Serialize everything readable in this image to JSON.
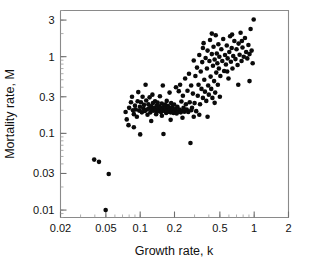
{
  "chart_data": {
    "type": "scatter",
    "title": "",
    "xlabel": "Growth rate, k",
    "ylabel": "Mortality rate, M",
    "xscale": "log",
    "yscale": "log",
    "xlim": [
      0.02,
      2
    ],
    "ylim": [
      0.008,
      4.0
    ],
    "grid": false,
    "legend": null,
    "xticks": [
      0.02,
      0.05,
      0.1,
      0.2,
      0.5,
      1,
      2
    ],
    "xtick_labels": [
      "0.02",
      "0.05",
      "0.1",
      "0.2",
      "0.5",
      "1",
      "2"
    ],
    "yticks": [
      0.01,
      0.03,
      0.1,
      0.3,
      1,
      3
    ],
    "ytick_labels": [
      "0.01",
      "0.03",
      "0.1",
      "0.3",
      "1",
      "3"
    ],
    "marker": "filled-circle",
    "marker_color": "#0a0a0a",
    "marker_size_px": 4.6,
    "n_points": 178,
    "points": [
      [
        0.0395,
        0.0455
      ],
      [
        0.0435,
        0.0425
      ],
      [
        0.053,
        0.0295
      ],
      [
        0.0498,
        0.01
      ],
      [
        0.0745,
        0.19
      ],
      [
        0.0762,
        0.152
      ],
      [
        0.079,
        0.128
      ],
      [
        0.08,
        0.215
      ],
      [
        0.083,
        0.255
      ],
      [
        0.0848,
        0.3
      ],
      [
        0.0865,
        0.2
      ],
      [
        0.088,
        0.178
      ],
      [
        0.09,
        0.23
      ],
      [
        0.0915,
        0.205
      ],
      [
        0.0935,
        0.165
      ],
      [
        0.095,
        0.262
      ],
      [
        0.0962,
        0.345
      ],
      [
        0.098,
        0.198
      ],
      [
        0.0995,
        0.222
      ],
      [
        0.1,
        0.097
      ],
      [
        0.1015,
        0.255
      ],
      [
        0.1035,
        0.188
      ],
      [
        0.105,
        0.3
      ],
      [
        0.1065,
        0.21
      ],
      [
        0.108,
        0.235
      ],
      [
        0.11,
        0.196
      ],
      [
        0.1115,
        0.43
      ],
      [
        0.113,
        0.268
      ],
      [
        0.1145,
        0.205
      ],
      [
        0.116,
        0.175
      ],
      [
        0.118,
        0.24
      ],
      [
        0.1195,
        0.212
      ],
      [
        0.121,
        0.295
      ],
      [
        0.123,
        0.188
      ],
      [
        0.1245,
        0.225
      ],
      [
        0.126,
        0.205
      ],
      [
        0.128,
        0.32
      ],
      [
        0.1295,
        0.248
      ],
      [
        0.131,
        0.198
      ],
      [
        0.133,
        0.215
      ],
      [
        0.135,
        0.262
      ],
      [
        0.1365,
        0.2
      ],
      [
        0.138,
        0.178
      ],
      [
        0.14,
        0.23
      ],
      [
        0.142,
        0.252
      ],
      [
        0.1435,
        0.208
      ],
      [
        0.1455,
        0.195
      ],
      [
        0.147,
        0.225
      ],
      [
        0.149,
        0.305
      ],
      [
        0.151,
        0.215
      ],
      [
        0.1525,
        0.19
      ],
      [
        0.1545,
        0.245
      ],
      [
        0.156,
        0.205
      ],
      [
        0.158,
        0.42
      ],
      [
        0.16,
        0.098
      ],
      [
        0.1615,
        0.222
      ],
      [
        0.1635,
        0.196
      ],
      [
        0.165,
        0.238
      ],
      [
        0.167,
        0.21
      ],
      [
        0.169,
        0.185
      ],
      [
        0.171,
        0.265
      ],
      [
        0.173,
        0.2
      ],
      [
        0.175,
        0.228
      ],
      [
        0.177,
        0.192
      ],
      [
        0.179,
        0.215
      ],
      [
        0.181,
        0.34
      ],
      [
        0.183,
        0.205
      ],
      [
        0.185,
        0.188
      ],
      [
        0.187,
        0.248
      ],
      [
        0.189,
        0.196
      ],
      [
        0.191,
        0.22
      ],
      [
        0.1935,
        0.202
      ],
      [
        0.196,
        0.185
      ],
      [
        0.1985,
        0.238
      ],
      [
        0.201,
        0.195
      ],
      [
        0.204,
        0.208
      ],
      [
        0.206,
        0.4
      ],
      [
        0.209,
        0.182
      ],
      [
        0.212,
        0.222
      ],
      [
        0.215,
        0.192
      ],
      [
        0.218,
        0.355
      ],
      [
        0.221,
        0.205
      ],
      [
        0.224,
        0.43
      ],
      [
        0.227,
        0.188
      ],
      [
        0.23,
        0.26
      ],
      [
        0.234,
        0.198
      ],
      [
        0.237,
        0.31
      ],
      [
        0.24,
        0.215
      ],
      [
        0.244,
        0.192
      ],
      [
        0.248,
        0.52
      ],
      [
        0.252,
        0.24
      ],
      [
        0.256,
        0.205
      ],
      [
        0.26,
        0.36
      ],
      [
        0.264,
        0.19
      ],
      [
        0.268,
        0.6
      ],
      [
        0.272,
        0.255
      ],
      [
        0.276,
        0.075
      ],
      [
        0.28,
        0.42
      ],
      [
        0.285,
        0.215
      ],
      [
        0.29,
        0.33
      ],
      [
        0.295,
        0.89
      ],
      [
        0.3,
        0.248
      ],
      [
        0.305,
        0.56
      ],
      [
        0.31,
        0.195
      ],
      [
        0.315,
        0.72
      ],
      [
        0.32,
        0.31
      ],
      [
        0.325,
        0.43
      ],
      [
        0.33,
        1.05
      ],
      [
        0.335,
        0.24
      ],
      [
        0.34,
        0.64
      ],
      [
        0.345,
        0.38
      ],
      [
        0.35,
        0.85
      ],
      [
        0.355,
        0.29
      ],
      [
        0.36,
        1.5
      ],
      [
        0.365,
        0.5
      ],
      [
        0.37,
        0.35
      ],
      [
        0.375,
        0.96
      ],
      [
        0.38,
        0.265
      ],
      [
        0.385,
        0.7
      ],
      [
        0.39,
        1.2
      ],
      [
        0.395,
        0.42
      ],
      [
        0.4,
        0.32
      ],
      [
        0.405,
        0.88
      ],
      [
        0.41,
        1.65
      ],
      [
        0.415,
        0.55
      ],
      [
        0.42,
        0.38
      ],
      [
        0.425,
        1.08
      ],
      [
        0.43,
        0.29
      ],
      [
        0.435,
        0.76
      ],
      [
        0.44,
        1.35
      ],
      [
        0.445,
        0.48
      ],
      [
        0.45,
        0.92
      ],
      [
        0.455,
        0.34
      ],
      [
        0.46,
        1.9
      ],
      [
        0.465,
        0.62
      ],
      [
        0.47,
        1.1
      ],
      [
        0.475,
        0.82
      ],
      [
        0.48,
        0.43
      ],
      [
        0.485,
        1.45
      ],
      [
        0.49,
        0.7
      ],
      [
        0.495,
        1.0
      ],
      [
        0.505,
        0.56
      ],
      [
        0.515,
        1.25
      ],
      [
        0.525,
        0.88
      ],
      [
        0.535,
        1.7
      ],
      [
        0.545,
        0.65
      ],
      [
        0.555,
        1.05
      ],
      [
        0.565,
        0.79
      ],
      [
        0.575,
        1.4
      ],
      [
        0.585,
        0.95
      ],
      [
        0.595,
        0.52
      ],
      [
        0.605,
        1.15
      ],
      [
        0.615,
        1.85
      ],
      [
        0.625,
        0.86
      ],
      [
        0.635,
        1.3
      ],
      [
        0.645,
        0.7
      ],
      [
        0.655,
        1.02
      ],
      [
        0.67,
        1.6
      ],
      [
        0.685,
        0.93
      ],
      [
        0.7,
        1.25
      ],
      [
        0.715,
        0.78
      ],
      [
        0.73,
        1.48
      ],
      [
        0.745,
        1.06
      ],
      [
        0.76,
        2.05
      ],
      [
        0.775,
        0.88
      ],
      [
        0.79,
        1.32
      ],
      [
        0.81,
        1.0
      ],
      [
        0.83,
        1.75
      ],
      [
        0.85,
        1.15
      ],
      [
        0.87,
        0.95
      ],
      [
        0.89,
        1.42
      ],
      [
        0.91,
        1.08
      ],
      [
        0.93,
        2.3
      ],
      [
        0.95,
        1.2
      ],
      [
        0.97,
        0.82
      ],
      [
        0.99,
        3.05
      ],
      [
        0.725,
        0.43
      ],
      [
        0.91,
        0.48
      ],
      [
        0.39,
        0.165
      ],
      [
        0.45,
        0.25
      ],
      [
        0.5,
        0.3
      ],
      [
        0.235,
        0.16
      ],
      [
        0.185,
        0.15
      ],
      [
        0.125,
        0.145
      ],
      [
        0.088,
        0.12
      ],
      [
        0.155,
        0.17
      ],
      [
        0.28,
        0.2
      ],
      [
        0.33,
        0.175
      ],
      [
        0.64,
        1.95
      ],
      [
        0.58,
        0.64
      ],
      [
        0.425,
        2.0
      ],
      [
        0.355,
        1.3
      ],
      [
        0.295,
        0.165
      ],
      [
        0.78,
        1.6
      ]
    ]
  }
}
